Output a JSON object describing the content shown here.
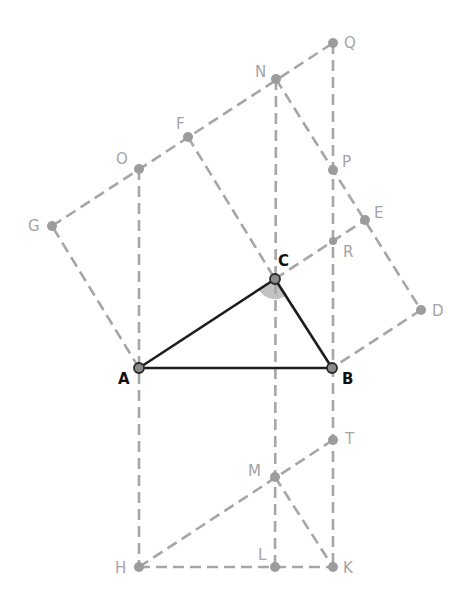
{
  "diagram": {
    "colors": {
      "construction": "#a6a6a6",
      "triangle": "#1c1c1c",
      "main_label": "#111111",
      "aux_label": "#a4a4a4",
      "angle_fill": "#c2c2c2"
    },
    "triangle": {
      "vertices": [
        "A",
        "B",
        "C"
      ],
      "angle_marked": "C"
    },
    "points": {
      "A": {
        "label": "A",
        "x": 139,
        "y": 368
      },
      "B": {
        "label": "B",
        "x": 332,
        "y": 368
      },
      "C": {
        "label": "C",
        "x": 275,
        "y": 279
      },
      "D": {
        "label": "D",
        "x": 421,
        "y": 310
      },
      "E": {
        "label": "E",
        "x": 365,
        "y": 220
      },
      "F": {
        "label": "F",
        "x": 188,
        "y": 137
      },
      "G": {
        "label": "G",
        "x": 52,
        "y": 226
      },
      "H": {
        "label": "H",
        "x": 139,
        "y": 567
      },
      "K": {
        "label": "K",
        "x": 333,
        "y": 567
      },
      "L": {
        "label": "L",
        "x": 275,
        "y": 567
      },
      "M": {
        "label": "M",
        "x": 275,
        "y": 477
      },
      "N": {
        "label": "N",
        "x": 276,
        "y": 79
      },
      "O": {
        "label": "O",
        "x": 139,
        "y": 169
      },
      "P": {
        "label": "P",
        "x": 333,
        "y": 170
      },
      "Q": {
        "label": "Q",
        "x": 333,
        "y": 43
      },
      "R": {
        "label": "R",
        "x": 333,
        "y": 241
      },
      "T": {
        "label": "T",
        "x": 333,
        "y": 440
      }
    },
    "solid_segments": [
      [
        "A",
        "B"
      ],
      [
        "B",
        "C"
      ],
      [
        "C",
        "A"
      ]
    ],
    "dashed_segments": [
      [
        "A",
        "G"
      ],
      [
        "G",
        "F"
      ],
      [
        "F",
        "C"
      ],
      [
        "F",
        "N"
      ],
      [
        "N",
        "Q"
      ],
      [
        "N",
        "E"
      ],
      [
        "E",
        "D"
      ],
      [
        "D",
        "B"
      ],
      [
        "C",
        "E"
      ],
      [
        "A",
        "H"
      ],
      [
        "H",
        "K"
      ],
      [
        "B",
        "K"
      ],
      [
        "Q",
        "B"
      ],
      [
        "N",
        "L"
      ],
      [
        "H",
        "T"
      ],
      [
        "M",
        "K"
      ]
    ]
  }
}
